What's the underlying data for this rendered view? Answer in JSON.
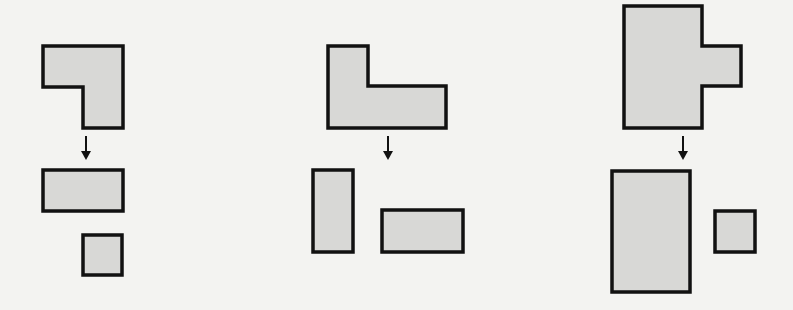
{
  "figure": {
    "colors": {
      "fill": "#d8d8d6",
      "stroke": "#111111",
      "background": "#f3f3f1"
    },
    "panels": [
      {
        "id": "panel-1",
        "composite": {
          "type": "L-shape",
          "points": "43,46 123,46 123,128 83,128 83,87 43,87"
        },
        "arrow": {
          "x": 86,
          "y1": 136,
          "y2": 160
        },
        "parts": [
          {
            "type": "rect",
            "x": 43,
            "y": 170,
            "w": 80,
            "h": 41
          },
          {
            "type": "square",
            "x": 83,
            "y": 235,
            "w": 39,
            "h": 40
          }
        ]
      },
      {
        "id": "panel-2",
        "composite": {
          "type": "L-shape",
          "points": "328,46 368,46 368,86 446,86 446,128 328,128"
        },
        "arrow": {
          "x": 388,
          "y1": 136,
          "y2": 160
        },
        "parts": [
          {
            "type": "rect",
            "x": 313,
            "y": 170,
            "w": 40,
            "h": 82
          },
          {
            "type": "rect",
            "x": 382,
            "y": 210,
            "w": 81,
            "h": 42
          }
        ]
      },
      {
        "id": "panel-3",
        "composite": {
          "type": "T-shape",
          "points": "624,6 702,6 702,46 741,46 741,86 702,86 702,128 624,128"
        },
        "arrow": {
          "x": 683,
          "y1": 136,
          "y2": 160
        },
        "parts": [
          {
            "type": "rect",
            "x": 612,
            "y": 171,
            "w": 78,
            "h": 121
          },
          {
            "type": "square",
            "x": 715,
            "y": 211,
            "w": 40,
            "h": 41
          }
        ]
      }
    ]
  }
}
